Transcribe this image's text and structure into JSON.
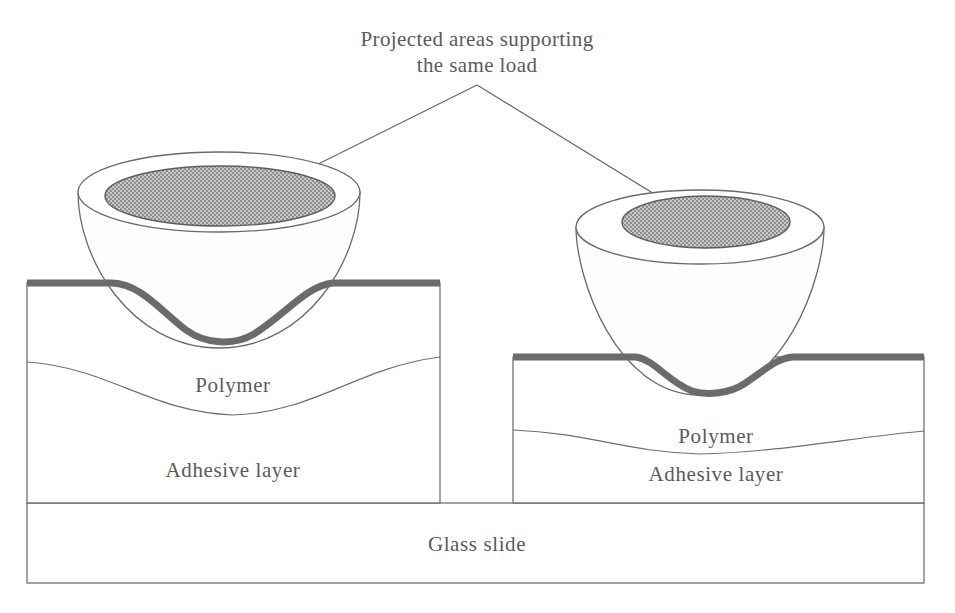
{
  "figure": {
    "caption": {
      "line1": "Projected areas supporting",
      "line2": "the same load"
    },
    "labels": {
      "polymer_left": "Polymer",
      "polymer_right": "Polymer",
      "adhesive_left": "Adhesive layer",
      "adhesive_right": "Adhesive layer",
      "glass_slide": "Glass slide"
    },
    "colors": {
      "stipple_gray": "#a8a8a8",
      "thick_surface_line": "#6b6b6b",
      "outline": "#6a6a6a",
      "text": "#5a5a5a",
      "arrow_fill": "#4d4d4d",
      "background": "#ffffff"
    },
    "annotations": {
      "left_sphere": "large hemisphere indenting polymer deeply",
      "right_sphere": "small hemisphere indenting polymer shallowly",
      "shared_meaning": "both stippled elliptical contact areas are equal and support the same load"
    }
  }
}
